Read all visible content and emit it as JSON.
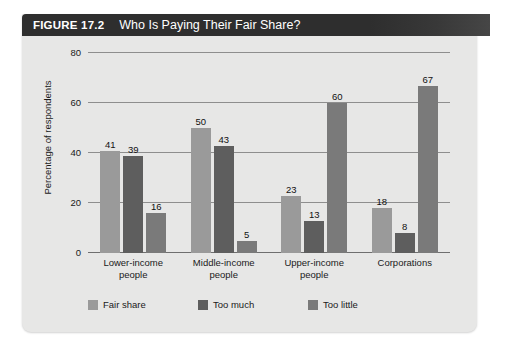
{
  "figure": {
    "number_label": "FIGURE 17.2",
    "title": "Who Is Paying Their Fair Share?"
  },
  "chart_data": {
    "type": "bar",
    "title": "Who Is Paying Their Fair Share?",
    "xlabel": "",
    "ylabel": "Percentage of respondents",
    "ylim": [
      0,
      80
    ],
    "yticks": [
      0,
      20,
      40,
      60,
      80
    ],
    "grid": true,
    "legend_position": "bottom-left",
    "categories": [
      "Lower-income people",
      "Middle-income people",
      "Upper-income people",
      "Corporations"
    ],
    "category_lines": [
      [
        "Lower-income",
        "people"
      ],
      [
        "Middle-income",
        "people"
      ],
      [
        "Upper-income",
        "people"
      ],
      [
        "Corporations",
        ""
      ]
    ],
    "series": [
      {
        "name": "Fair share",
        "color": "#9a9a9a",
        "values": [
          41,
          50,
          23,
          18
        ]
      },
      {
        "name": "Too much",
        "color": "#5e5e5e",
        "values": [
          39,
          43,
          13,
          8
        ]
      },
      {
        "name": "Too little",
        "color": "#7a7a7a",
        "values": [
          16,
          5,
          60,
          67
        ]
      }
    ]
  },
  "colors": {
    "panel_background": "#e7e7e6",
    "title_bar": "#2e2e2e",
    "title_text": "#ffffff",
    "gridline": "#8e8e8e",
    "text": "#1a1a1a"
  }
}
